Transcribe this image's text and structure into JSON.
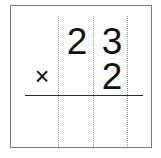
{
  "worksheet": {
    "type": "vertical-multiplication",
    "operator": "×",
    "operator_name": "multiplication-sign",
    "multiplicand": "23",
    "multiplier": "2",
    "answer": "",
    "rows": [
      {
        "role": "multiplicand",
        "operator": "",
        "digits": [
          "2",
          "3"
        ]
      },
      {
        "role": "multiplier",
        "operator": "×",
        "digits": [
          "",
          "2"
        ]
      }
    ],
    "columns": [
      "tens",
      "ones"
    ],
    "guides": {
      "column_rule_style": "dotted",
      "column_rule_color": "#9a9a9a",
      "column_rule_count": 3,
      "answer_rule_color": "#2a2a2a"
    },
    "colors": {
      "background": "#ffffff",
      "border": "#7c7c7c",
      "digit": "#111111"
    }
  }
}
